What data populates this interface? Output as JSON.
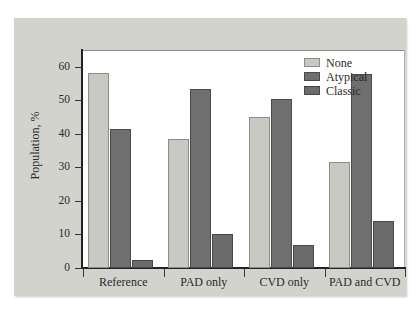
{
  "chart_data": {
    "type": "bar",
    "title": "",
    "xlabel": "",
    "ylabel": "Population, %",
    "ylim": [
      0,
      65
    ],
    "ytick_labels": [
      "0",
      "10",
      "20",
      "30",
      "40",
      "50",
      "60"
    ],
    "ytick_values": [
      0,
      10,
      20,
      30,
      40,
      50,
      60
    ],
    "grid": false,
    "legend_position": "top-right",
    "categories": [
      "Reference",
      "PAD only",
      "CVD only",
      "PAD and CVD"
    ],
    "series": [
      {
        "name": "None",
        "color": "#c9c9c4",
        "values": [
          58,
          38.5,
          45,
          31.5
        ]
      },
      {
        "name": "Atypical",
        "color": "#6f6f6f",
        "values": [
          41.5,
          53.5,
          50.5,
          57.8
        ]
      },
      {
        "name": "Classic",
        "color": "#6b6b6b",
        "values": [
          2.5,
          10,
          6.8,
          14
        ]
      }
    ]
  },
  "figure": {
    "panel_background": "#d3d3ce",
    "plot_background": "#ffffff",
    "axis_color": "#232323"
  }
}
